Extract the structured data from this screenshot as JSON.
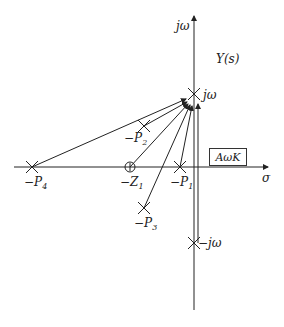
{
  "diagram": {
    "title": "Y(s)",
    "axes": {
      "vertical": "jω",
      "horizontal": "σ"
    },
    "points": {
      "jw": {
        "label": "jω",
        "type": "pole"
      },
      "neg_jw": {
        "label": "−jω",
        "type": "pole"
      },
      "P1": {
        "label": "−P",
        "sub": "1",
        "type": "pole"
      },
      "P2": {
        "label": "−P",
        "sub": "2",
        "type": "pole"
      },
      "P3": {
        "label": "−P",
        "sub": "3",
        "type": "pole"
      },
      "P4": {
        "label": "−P",
        "sub": "4",
        "type": "pole"
      },
      "Z1": {
        "label": "−Z",
        "sub": "1",
        "type": "zero"
      }
    },
    "gain_box": "AωK"
  }
}
